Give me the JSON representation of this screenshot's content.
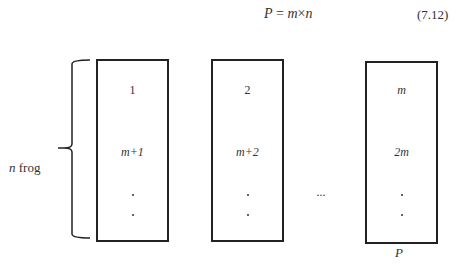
{
  "equation": {
    "lhs": "P",
    "equals": " = ",
    "m": "m",
    "times": "×",
    "n": "n",
    "number": "(7.12)"
  },
  "brace_label": {
    "var": "n",
    "text": " frog"
  },
  "boxes": [
    {
      "top": "1",
      "middle": "m+1"
    },
    {
      "top": "2",
      "middle": "m+2"
    },
    {
      "top": "m",
      "middle": "2m"
    }
  ],
  "ellipsis": "···",
  "last_box_label": "P",
  "colors": {
    "stroke": "#222222",
    "text": "#333333",
    "background": "#ffffff"
  }
}
